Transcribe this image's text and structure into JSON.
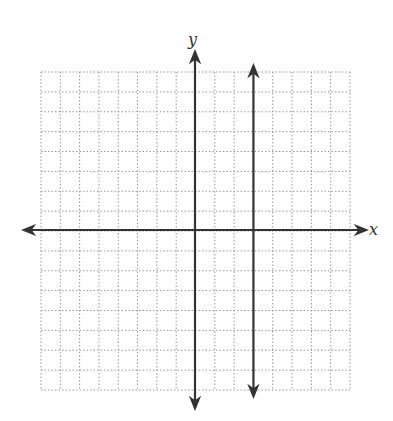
{
  "chart_data": {
    "type": "line",
    "title": "",
    "xlabel": "x",
    "ylabel": "y",
    "xlim": [
      -8,
      8
    ],
    "ylim": [
      -8,
      8
    ],
    "grid": true,
    "grid_style": "dotted",
    "grid_step": 1,
    "tick_labels": false,
    "series": [
      {
        "name": "vertical line",
        "equation": "x = 3",
        "x": [
          3,
          3
        ],
        "y": [
          -8.5,
          8.5
        ],
        "arrows": "both"
      }
    ]
  },
  "labels": {
    "x_axis": "x",
    "y_axis": "y"
  },
  "colors": {
    "axis": "#333333",
    "grid": "#999999",
    "line": "#333333"
  }
}
